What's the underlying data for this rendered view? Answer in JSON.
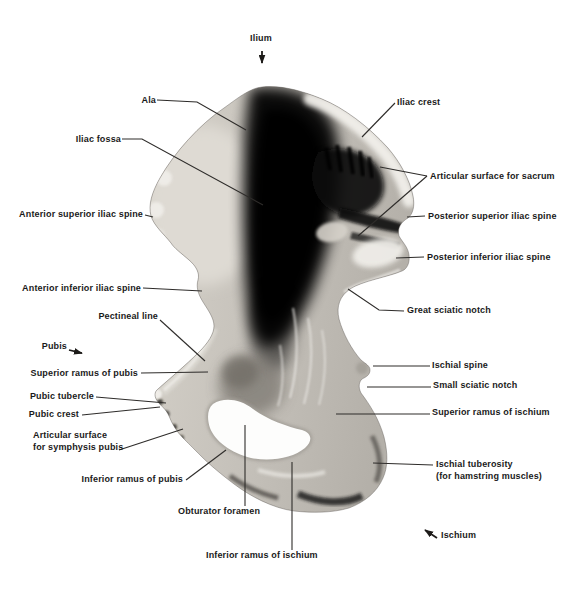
{
  "figure": {
    "labels": {
      "ilium": "Ilium",
      "ala": "Ala",
      "iliac_fossa": "Iliac fossa",
      "iliac_crest": "Iliac crest",
      "articular_surface_sacrum": "Articular surface for sacrum",
      "posterior_superior_iliac_spine": "Posterior superior iliac spine",
      "posterior_inferior_iliac_spine": "Posterior inferior iliac spine",
      "great_sciatic_notch": "Great sciatic notch",
      "anterior_superior_iliac_spine": "Anterior superior iliac spine",
      "anterior_inferior_iliac_spine": "Anterior inferior iliac spine",
      "pectineal_line": "Pectineal line",
      "pubis": "Pubis",
      "superior_ramus_of_pubis": "Superior ramus of pubis",
      "pubic_tubercle": "Pubic tubercle",
      "pubic_crest": "Pubic crest",
      "articular_surface_symphysis_line1": "Articular surface",
      "articular_surface_symphysis_line2": "for symphysis pubis",
      "inferior_ramus_of_pubis": "Inferior ramus of pubis",
      "obturator_foramen": "Obturator foramen",
      "inferior_ramus_of_ischium": "Inferior ramus of ischium",
      "ischial_spine": "Ischial spine",
      "small_sciatic_notch": "Small sciatic notch",
      "superior_ramus_of_ischium": "Superior ramus of ischium",
      "ischial_tuberosity_line1": "Ischial tuberosity",
      "ischial_tuberosity_line2": "(for hamstring muscles)",
      "ischium": "Ischium"
    },
    "colors": {
      "background": "#ffffff",
      "label_text": "#1a1a1a",
      "leader_line": "#2e2c2a",
      "bone_light": "#d7d3cb",
      "bone_mid": "#b3afa8",
      "bone_dark": "#0a0a0a"
    }
  }
}
